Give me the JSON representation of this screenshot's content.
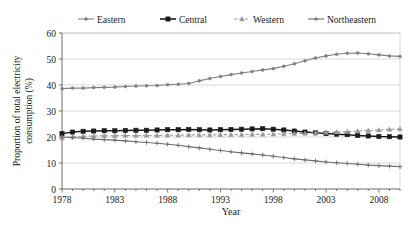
{
  "chart_data": {
    "type": "line",
    "title": "",
    "xlabel": "Year",
    "ylabel_line1": "Proportion of total electricity",
    "ylabel_line2": "consumption (%)",
    "ylabel": "Proportion of total electricity consumption (%)",
    "xlim": [
      1978,
      2010
    ],
    "ylim": [
      0,
      60
    ],
    "yticks": [
      0,
      10,
      20,
      30,
      40,
      50,
      60
    ],
    "ytick_labels": [
      "0",
      "10",
      "20",
      "30",
      "40",
      "50",
      "60"
    ],
    "xticks_labeled": [
      1978,
      1983,
      1988,
      1993,
      1998,
      2003,
      2008
    ],
    "xtick_labels": [
      "1978",
      "1983",
      "1988",
      "1993",
      "1998",
      "2003",
      "2008"
    ],
    "x": [
      1978,
      1979,
      1980,
      1981,
      1982,
      1983,
      1984,
      1985,
      1986,
      1987,
      1988,
      1989,
      1990,
      1991,
      1992,
      1993,
      1994,
      1995,
      1996,
      1997,
      1998,
      1999,
      2000,
      2001,
      2002,
      2003,
      2004,
      2005,
      2006,
      2007,
      2008,
      2009,
      2010
    ],
    "grid": "horizontal",
    "legend_position": "top",
    "series": [
      {
        "name": "Eastern",
        "marker": "dot",
        "linestyle": "solid",
        "color": "#808080",
        "values": [
          38.6,
          38.8,
          38.8,
          39.0,
          39.1,
          39.2,
          39.4,
          39.6,
          39.7,
          39.8,
          40.1,
          40.3,
          40.6,
          41.6,
          42.5,
          43.3,
          44.0,
          44.6,
          45.2,
          45.8,
          46.3,
          47.2,
          48.2,
          49.3,
          50.4,
          51.2,
          51.8,
          52.2,
          52.3,
          52.0,
          51.6,
          51.2,
          51.0
        ]
      },
      {
        "name": "Central",
        "marker": "square",
        "linestyle": "solid",
        "color": "#1a1a1a",
        "values": [
          21.3,
          21.9,
          22.2,
          22.3,
          22.4,
          22.4,
          22.5,
          22.6,
          22.6,
          22.7,
          22.8,
          22.8,
          22.9,
          22.8,
          22.7,
          22.8,
          22.9,
          23.0,
          23.1,
          23.2,
          23.0,
          22.7,
          22.3,
          21.9,
          21.6,
          21.3,
          21.1,
          20.9,
          20.6,
          20.4,
          20.2,
          20.1,
          20.0
        ]
      },
      {
        "name": "Western",
        "marker": "triangle",
        "linestyle": "dashed",
        "color": "#999999",
        "values": [
          19.6,
          20.1,
          20.3,
          20.4,
          20.5,
          20.5,
          20.6,
          20.6,
          20.6,
          20.6,
          20.7,
          20.7,
          20.8,
          20.8,
          20.8,
          20.9,
          20.9,
          20.9,
          21.0,
          21.0,
          21.1,
          21.2,
          21.3,
          21.4,
          21.6,
          21.8,
          21.9,
          22.1,
          22.3,
          22.5,
          22.7,
          22.9,
          23.1
        ]
      },
      {
        "name": "Northeastern",
        "marker": "plus",
        "linestyle": "solid",
        "color": "#6e6e6e",
        "values": [
          20.0,
          19.8,
          19.5,
          19.2,
          19.0,
          18.8,
          18.5,
          18.2,
          17.9,
          17.6,
          17.2,
          16.8,
          16.3,
          15.8,
          15.3,
          14.8,
          14.3,
          13.9,
          13.5,
          13.1,
          12.6,
          12.1,
          11.6,
          11.2,
          10.8,
          10.4,
          10.1,
          9.8,
          9.5,
          9.2,
          9.0,
          8.8,
          8.6
        ]
      }
    ]
  },
  "legend": {
    "items": [
      {
        "label": "Eastern"
      },
      {
        "label": "Central"
      },
      {
        "label": "Western"
      },
      {
        "label": "Northeastern"
      }
    ]
  }
}
